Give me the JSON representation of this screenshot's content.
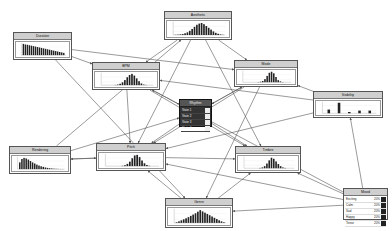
{
  "diagram": {
    "type": "bayesian-network",
    "nodes": [
      {
        "id": "aesthetic",
        "label": "Aesthetic",
        "x": 164,
        "y": 11,
        "w": 68,
        "h": 29,
        "kind": "histogram",
        "bars": [
          0.02,
          0.03,
          0.05,
          0.08,
          0.14,
          0.22,
          0.35,
          0.5,
          0.68,
          0.85,
          0.95,
          1.0,
          0.9,
          0.75,
          0.6,
          0.45,
          0.3,
          0.18,
          0.1,
          0.05,
          0.02
        ]
      },
      {
        "id": "duration",
        "label": "Duration",
        "x": 13,
        "y": 32,
        "w": 59,
        "h": 28,
        "kind": "histogram",
        "bars": [
          1.0,
          0.95,
          0.92,
          0.88,
          0.84,
          0.8,
          0.76,
          0.72,
          0.68,
          0.64,
          0.6,
          0.56,
          0.52,
          0.48,
          0.44,
          0.4,
          0.36,
          0.32,
          0.28,
          0.24,
          0.2
        ]
      },
      {
        "id": "bpm",
        "label": "BPM",
        "x": 92,
        "y": 62,
        "w": 68,
        "h": 28,
        "kind": "histogram",
        "bars": [
          0,
          0,
          0,
          0,
          0,
          0.02,
          0.05,
          0.12,
          0.25,
          0.45,
          0.7,
          0.9,
          1.0,
          0.85,
          0.6,
          0.35,
          0.15,
          0.05,
          0.02,
          0,
          0
        ]
      },
      {
        "id": "mode",
        "label": "Mode",
        "x": 234,
        "y": 60,
        "w": 64,
        "h": 27,
        "kind": "histogram",
        "bars": [
          0,
          0,
          0,
          0,
          0,
          0,
          0.02,
          0.05,
          0.12,
          0.3,
          0.6,
          0.9,
          1.0,
          0.85,
          0.5,
          0.2,
          0.08,
          0.02,
          0,
          0,
          0
        ]
      },
      {
        "id": "rhythm",
        "label": "Rhythm",
        "x": 179,
        "y": 99,
        "w": 33,
        "h": 28,
        "kind": "table-dark",
        "rows": [
          {
            "name": "State 1",
            "value": ""
          },
          {
            "name": "State 2",
            "value": ""
          },
          {
            "name": "State 3",
            "value": ""
          },
          {
            "name": "State 4",
            "value": ""
          }
        ]
      },
      {
        "id": "stability",
        "label": "Stability",
        "x": 313,
        "y": 91,
        "w": 70,
        "h": 27,
        "kind": "bars",
        "bars": [
          0.35,
          1.0,
          0.12,
          0.25,
          0.25
        ],
        "ticks": [
          "0",
          "1",
          "2",
          "3",
          "4"
        ]
      },
      {
        "id": "rendering",
        "label": "Rendering",
        "x": 9,
        "y": 146,
        "w": 62,
        "h": 28,
        "kind": "histogram",
        "bars": [
          0.6,
          0.9,
          1.0,
          0.95,
          0.85,
          0.72,
          0.6,
          0.5,
          0.4,
          0.32,
          0.25,
          0.2,
          0.15,
          0.11,
          0.08,
          0.06,
          0.04,
          0.03,
          0.02,
          0.01,
          0.01
        ]
      },
      {
        "id": "pitch",
        "label": "Pitch",
        "x": 96,
        "y": 143,
        "w": 70,
        "h": 28,
        "kind": "histogram",
        "bars": [
          0,
          0,
          0,
          0,
          0,
          0,
          0.03,
          0.08,
          0.2,
          0.4,
          0.7,
          0.95,
          1.0,
          0.8,
          0.5,
          0.25,
          0.1,
          0.03,
          0,
          0,
          0
        ]
      },
      {
        "id": "timbre",
        "label": "Timbre",
        "x": 235,
        "y": 146,
        "w": 66,
        "h": 27,
        "kind": "histogram",
        "bars": [
          0,
          0,
          0,
          0,
          0,
          0,
          0.03,
          0.08,
          0.2,
          0.45,
          0.75,
          1.0,
          0.9,
          0.65,
          0.4,
          0.2,
          0.08,
          0.03,
          0,
          0,
          0
        ]
      },
      {
        "id": "genre",
        "label": "Genre",
        "x": 165,
        "y": 198,
        "w": 68,
        "h": 30,
        "kind": "histogram",
        "bars": [
          0.05,
          0.12,
          0.2,
          0.28,
          0.36,
          0.45,
          0.55,
          0.65,
          0.75,
          0.88,
          1.0,
          0.9,
          0.8,
          0.7,
          0.6,
          0.5,
          0.4,
          0.3,
          0.2,
          0.12,
          0.05
        ]
      },
      {
        "id": "mood",
        "label": "Mood",
        "x": 343,
        "y": 188,
        "w": 45,
        "h": 32,
        "kind": "table",
        "rows": [
          {
            "name": "Exciting",
            "value": "20%"
          },
          {
            "name": "Calm",
            "value": "20%"
          },
          {
            "name": "Sad",
            "value": "20%"
          },
          {
            "name": "Happy",
            "value": "20%"
          },
          {
            "name": "Tense",
            "value": "20%"
          }
        ]
      }
    ],
    "edges": [
      [
        "duration",
        "bpm"
      ],
      [
        "duration",
        "mode"
      ],
      [
        "duration",
        "genre"
      ],
      [
        "aesthetic",
        "bpm"
      ],
      [
        "aesthetic",
        "mode"
      ],
      [
        "aesthetic",
        "pitch"
      ],
      [
        "aesthetic",
        "timbre"
      ],
      [
        "bpm",
        "rhythm"
      ],
      [
        "bpm",
        "pitch"
      ],
      [
        "bpm",
        "timbre"
      ],
      [
        "mode",
        "rhythm"
      ],
      [
        "mode",
        "pitch"
      ],
      [
        "mode",
        "genre"
      ],
      [
        "rhythm",
        "pitch"
      ],
      [
        "rhythm",
        "timbre"
      ],
      [
        "rhythm",
        "mode"
      ],
      [
        "stability",
        "bpm"
      ],
      [
        "stability",
        "pitch"
      ],
      [
        "stability",
        "mode"
      ],
      [
        "rendering",
        "pitch"
      ],
      [
        "rendering",
        "aesthetic"
      ],
      [
        "rendering",
        "rhythm"
      ],
      [
        "pitch",
        "rendering"
      ],
      [
        "pitch",
        "timbre"
      ],
      [
        "mood",
        "stability"
      ],
      [
        "mood",
        "timbre"
      ],
      [
        "mood",
        "genre"
      ],
      [
        "mood",
        "pitch"
      ],
      [
        "mood",
        "bpm"
      ],
      [
        "genre",
        "pitch"
      ],
      [
        "genre",
        "timbre"
      ]
    ]
  },
  "colors": {
    "edge": "#555555",
    "bar": "#222222",
    "title_bg": "#cfcfcf",
    "dark_node": "#333333"
  }
}
